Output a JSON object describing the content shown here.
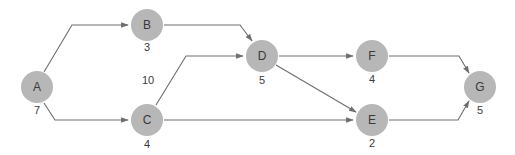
{
  "diagram": {
    "type": "activity-network",
    "colors": {
      "node_fill": "#b7b7b7",
      "edge": "#6e6e6e",
      "text": "#3a3a3a"
    },
    "nodes": [
      {
        "id": "A",
        "label": "A",
        "duration": "7",
        "x": 37,
        "y": 87
      },
      {
        "id": "B",
        "label": "B",
        "duration": "3",
        "x": 147,
        "y": 25
      },
      {
        "id": "C",
        "label": "C",
        "duration": "4",
        "x": 147,
        "y": 120
      },
      {
        "id": "D",
        "label": "D",
        "duration": "5",
        "x": 262,
        "y": 56
      },
      {
        "id": "F",
        "label": "F",
        "duration": "4",
        "x": 372,
        "y": 56
      },
      {
        "id": "E",
        "label": "E",
        "duration": "2",
        "x": 372,
        "y": 120
      },
      {
        "id": "G",
        "label": "G",
        "duration": "5",
        "x": 480,
        "y": 87
      }
    ],
    "edges": [
      {
        "from": "A",
        "to": "B"
      },
      {
        "from": "A",
        "to": "C"
      },
      {
        "from": "B",
        "to": "D"
      },
      {
        "from": "C",
        "to": "D"
      },
      {
        "from": "C",
        "to": "E"
      },
      {
        "from": "D",
        "to": "F"
      },
      {
        "from": "D",
        "to": "E"
      },
      {
        "from": "F",
        "to": "G"
      },
      {
        "from": "E",
        "to": "G"
      }
    ],
    "floating_label": {
      "text": "10",
      "x": 148,
      "y": 80
    }
  }
}
